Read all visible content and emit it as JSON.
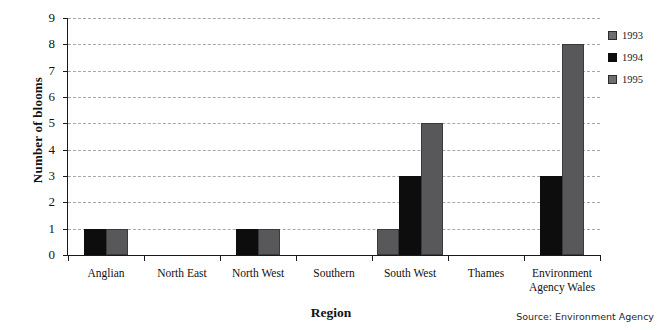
{
  "chart_data": {
    "type": "bar",
    "title": "",
    "xlabel": "Region",
    "ylabel": "Number of blooms",
    "categories": [
      "Anglian",
      "North East",
      "North West",
      "Southern",
      "South West",
      "Thames",
      "Environment Agency Wales"
    ],
    "series": [
      {
        "name": "1993",
        "color": "#58585a",
        "values": [
          0,
          0,
          0,
          0,
          1,
          0,
          0
        ]
      },
      {
        "name": "1994",
        "color": "#0d0d0d",
        "values": [
          1,
          0,
          1,
          0,
          3,
          0,
          3
        ]
      },
      {
        "name": "1995",
        "color": "#58585a",
        "values": [
          1,
          0,
          1,
          0,
          5,
          0,
          8
        ]
      }
    ],
    "ylim": [
      0,
      9
    ],
    "ytick_labels": [
      "0",
      "1",
      "2",
      "3",
      "4",
      "5",
      "6",
      "7",
      "8",
      "9"
    ],
    "grid": true,
    "legend_position": "right"
  },
  "legend": {
    "entries": [
      {
        "label": "1993"
      },
      {
        "label": "1994"
      },
      {
        "label": "1995"
      }
    ]
  },
  "footer": {
    "source": "Source: Environment Agency"
  }
}
